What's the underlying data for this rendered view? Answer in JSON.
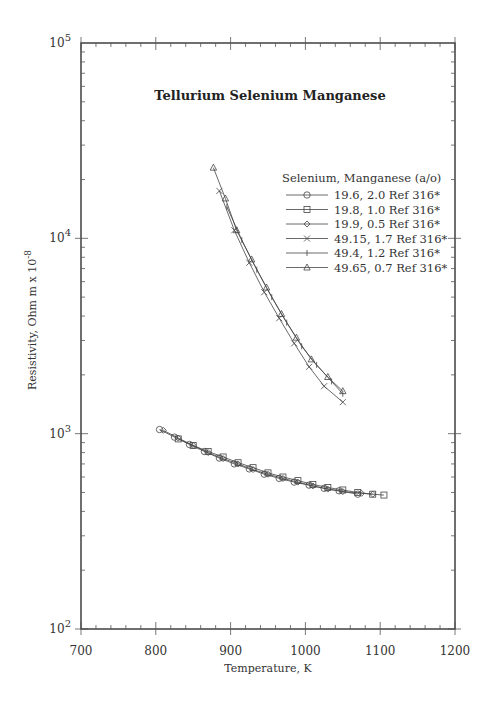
{
  "chart_data": {
    "type": "line",
    "title": "Tellurium Selenium Manganese",
    "xlabel": "Temperature,  K",
    "ylabel": "Resistivity, Ohm m x 10^-8",
    "ylabel_parts": {
      "base": "Resistivity, Ohm  m x 10",
      "exp": "-8"
    },
    "xlim": [
      700,
      1200
    ],
    "ylim": [
      100,
      100000
    ],
    "yscale": "log",
    "grid": false,
    "x_ticks": [
      700,
      800,
      900,
      1000,
      1100,
      1200
    ],
    "y_ticks": [
      {
        "value": 100,
        "base": "10",
        "exp": "2"
      },
      {
        "value": 1000,
        "base": "10",
        "exp": "3"
      },
      {
        "value": 10000,
        "base": "10",
        "exp": "4"
      },
      {
        "value": 100000,
        "base": "10",
        "exp": "5"
      }
    ],
    "legend_title": "Selenium, Manganese (a/o)",
    "legend_position": "upper right",
    "series": [
      {
        "name": "19.6, 2.0 Ref 316*",
        "marker": "circle",
        "x": [
          805,
          825,
          845,
          865,
          885,
          905,
          925,
          945,
          965,
          985,
          1005,
          1025,
          1045,
          1070
        ],
        "y": [
          1050,
          960,
          880,
          810,
          750,
          700,
          660,
          620,
          590,
          565,
          545,
          525,
          510,
          490
        ]
      },
      {
        "name": "19.8, 1.0 Ref 316*",
        "marker": "square",
        "x": [
          830,
          850,
          870,
          890,
          910,
          930,
          950,
          970,
          990,
          1010,
          1030,
          1050,
          1070,
          1090,
          1105
        ],
        "y": [
          940,
          870,
          810,
          760,
          710,
          670,
          630,
          600,
          575,
          550,
          530,
          515,
          500,
          490,
          485
        ]
      },
      {
        "name": "19.9, 0.5 Ref 316*",
        "marker": "diamond",
        "x": [
          810,
          830,
          850,
          870,
          890,
          910,
          930,
          950,
          970,
          990,
          1010,
          1030,
          1050,
          1075,
          1090
        ],
        "y": [
          1040,
          950,
          870,
          800,
          745,
          700,
          655,
          620,
          590,
          565,
          540,
          520,
          505,
          495,
          490
        ]
      },
      {
        "name": "49.15, 1.7 Ref 316*",
        "marker": "x",
        "x": [
          885,
          905,
          925,
          945,
          965,
          985,
          1005,
          1025,
          1050
        ],
        "y": [
          17500,
          11000,
          7500,
          5300,
          3900,
          2900,
          2200,
          1750,
          1450
        ]
      },
      {
        "name": "49.4, 1.2 Ref 316*",
        "marker": "plus",
        "x": [
          895,
          915,
          935,
          955,
          975,
          995,
          1015,
          1035,
          1050
        ],
        "y": [
          14500,
          9800,
          6900,
          5000,
          3700,
          2800,
          2250,
          1850,
          1600
        ]
      },
      {
        "name": "49.65, 0.7 Ref 316*",
        "marker": "triangle",
        "x": [
          877,
          893,
          908,
          928,
          948,
          968,
          988,
          1008,
          1030,
          1050
        ],
        "y": [
          23000,
          16000,
          11000,
          7800,
          5600,
          4100,
          3100,
          2400,
          1950,
          1650
        ]
      }
    ]
  }
}
